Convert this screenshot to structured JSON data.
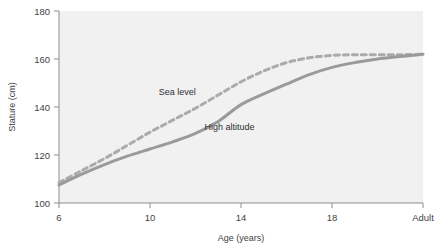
{
  "chart_data": {
    "type": "line",
    "title": "",
    "xlabel": "Age (years)",
    "ylabel": "Stature (cm)",
    "x_tick_labels": [
      "6",
      "10",
      "14",
      "18",
      "Adult"
    ],
    "x_tick_values": [
      6,
      10,
      14,
      18,
      22
    ],
    "y_tick_labels": [
      "100",
      "120",
      "140",
      "160",
      "180"
    ],
    "y_tick_values": [
      100,
      120,
      140,
      160,
      180
    ],
    "xlim": [
      6,
      22
    ],
    "ylim": [
      100,
      180
    ],
    "grid": false,
    "legend": "inline-annotations",
    "plot_background": "#f1f1f1",
    "series": [
      {
        "name": "Sea level",
        "style": "dashed",
        "color": "#ababab",
        "label_x": 11.2,
        "label_y": 145.0,
        "x": [
          6,
          7,
          8,
          9,
          10,
          11,
          12,
          13,
          14,
          15,
          16,
          17,
          18,
          19,
          20,
          21,
          22
        ],
        "values": [
          108.5,
          113.5,
          118.5,
          124.0,
          129.5,
          134.5,
          139.5,
          145.0,
          150.5,
          155.0,
          158.5,
          160.5,
          161.5,
          161.8,
          161.8,
          161.8,
          162.0
        ]
      },
      {
        "name": "High altitude",
        "style": "solid",
        "color": "#9a9a9a",
        "label_x": 13.5,
        "label_y": 130.5,
        "x": [
          6,
          7,
          8,
          9,
          10,
          11,
          12,
          13,
          14,
          15,
          16,
          17,
          18,
          19,
          20,
          21,
          22
        ],
        "values": [
          107.5,
          112.0,
          116.0,
          119.5,
          122.5,
          125.5,
          129.0,
          134.0,
          141.0,
          145.5,
          149.5,
          153.5,
          156.5,
          158.5,
          160.0,
          161.0,
          162.0
        ]
      }
    ],
    "annotations": [
      {
        "text": "Sea level",
        "x": 11.2,
        "y": 145.0
      },
      {
        "text": "High altitude",
        "x": 13.5,
        "y": 130.5
      }
    ]
  },
  "axes": {
    "y_title": "Stature (cm)",
    "x_title": "Age (years)"
  }
}
